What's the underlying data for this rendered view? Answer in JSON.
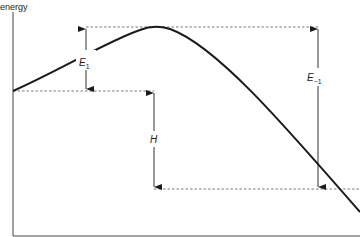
{
  "diagram": {
    "axis_label_y": "energy",
    "labels": {
      "forward_activation": {
        "main": "E",
        "sub": "1"
      },
      "enthalpy": {
        "main": "H"
      },
      "reverse_activation": {
        "main": "E",
        "sub": "−1"
      }
    },
    "colors": {
      "line": "#1a1a1a",
      "dashed": "#555555",
      "background": "#ffffff"
    }
  }
}
